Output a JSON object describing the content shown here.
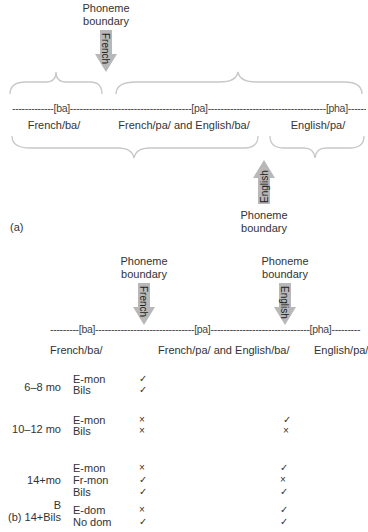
{
  "panel_a": {
    "label": "(a)",
    "top_boundary": {
      "title_line1": "Phoneme",
      "title_line2": "boundary",
      "arrow_label": "French",
      "direction": "down"
    },
    "bottom_boundary": {
      "title_line1": "Phoneme",
      "title_line2": "boundary",
      "arrow_label": "English",
      "direction": "up"
    },
    "continuum": "-------------[ba]--------------------------------------[pa]-------------------------------------[pha]----------",
    "categories": [
      "French/ba/",
      "French/pa/ and English/ba/",
      "English/pa/"
    ]
  },
  "panel_b": {
    "label": "(b)",
    "boundaries": [
      {
        "title_line1": "Phoneme",
        "title_line2": "boundary",
        "arrow_label": "French"
      },
      {
        "title_line1": "Phoneme",
        "title_line2": "boundary",
        "arrow_label": "English"
      }
    ],
    "continuum": "---------[ba]-------------------------------[pa]-------------------------------[pha]---------",
    "categories": [
      "French/ba/",
      "French/pa/ and English/ba/",
      "English/pa/"
    ],
    "groups": [
      {
        "age": "6–8 mo",
        "rows": [
          {
            "group": "E-mon",
            "french": "check",
            "english": ""
          },
          {
            "group": "Bils",
            "french": "check",
            "english": ""
          }
        ]
      },
      {
        "age": "10–12 mo",
        "rows": [
          {
            "group": "E-mon",
            "french": "cross",
            "english": "check"
          },
          {
            "group": "Bils",
            "french": "cross",
            "english": "cross"
          }
        ]
      },
      {
        "age": "14+mo",
        "rows": [
          {
            "group": "E-mon",
            "french": "cross",
            "english": "check"
          },
          {
            "group": "Fr-mon",
            "french": "check",
            "english": "cross"
          },
          {
            "group": "Bils",
            "french": "check",
            "english": "check"
          }
        ]
      },
      {
        "age_line1": "B",
        "age_line2": "14+Bils",
        "rows": [
          {
            "group": "E-dom",
            "french": "cross",
            "english": "check"
          },
          {
            "group": "No dom",
            "french": "check",
            "english": "check"
          }
        ]
      }
    ]
  },
  "symbols": {
    "check": "✓",
    "cross": "×"
  },
  "colors": {
    "arrow": "#b8b8b8",
    "brace": "#c8c8c8",
    "text": "#333333"
  }
}
